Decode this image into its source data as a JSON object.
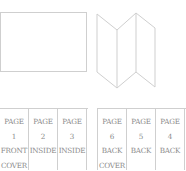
{
  "diagram": {
    "flat_sheet": {
      "label": ""
    },
    "folded_view": {
      "panels": 3
    },
    "front_side": {
      "columns": [
        {
          "page_label": "PAGE",
          "page_num": "1",
          "side": "FRONT",
          "extra": "COVER"
        },
        {
          "page_label": "PAGE",
          "page_num": "2",
          "side": "INSIDE",
          "extra": ""
        },
        {
          "page_label": "PAGE",
          "page_num": "3",
          "side": "INSIDE",
          "extra": ""
        }
      ]
    },
    "back_side": {
      "columns": [
        {
          "page_label": "PAGE",
          "page_num": "6",
          "side": "BACK",
          "extra": "COVER"
        },
        {
          "page_label": "PAGE",
          "page_num": "5",
          "side": "BACK",
          "extra": ""
        },
        {
          "page_label": "PAGE",
          "page_num": "4",
          "side": "BACK",
          "extra": ""
        }
      ]
    },
    "colors": {
      "line": "#cfcfcf",
      "text": "#8a8a8a"
    }
  }
}
